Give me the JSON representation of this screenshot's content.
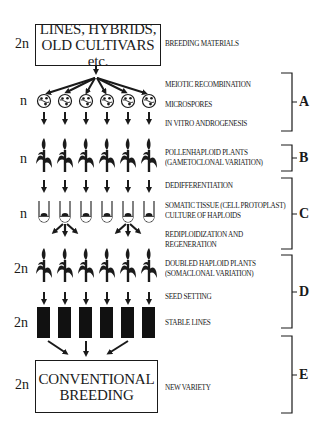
{
  "top_box": {
    "ploidy": "2n",
    "line1": "LINES, HYBRIDS,",
    "line2": "OLD CULTIVARS etc."
  },
  "bottom_box": {
    "ploidy": "2n",
    "line1": "CONVENTIONAL",
    "line2": "BREEDING"
  },
  "ploidy_labels": {
    "microspores": "n",
    "pollen_plants": "n",
    "tubes": "n",
    "doubled_plants": "2n",
    "stable_lines": "2n"
  },
  "stage_labels": {
    "breeding_materials": "BREEDING MATERIALS",
    "meiotic_recombination": "MEIOTIC RECOMBINATION",
    "microspores": "MICROSPORES",
    "in_vitro_androgenesis": "IN VITRO ANDROGENESIS",
    "pollenhaploid_plants": "POLLENHAPLOID PLANTS",
    "gametoclonal_variation": "(GAMETOCLONAL VARIATION)",
    "dedifferentiation": "DEDIFFERENTIATION",
    "somatic_tissue": "SOMATIC TISSUE (CELL PROTOPLAST)",
    "culture_of_haploids": "CULTURE OF HAPLOIDS",
    "rediploidization": "REDIPLOIDIZATION AND",
    "regeneration": "REGENERATION",
    "doubled_haploid_plants": "DOUBLED HAPLOID PLANTS",
    "somaclonal_variation": "(SOMACLONAL VARIATION)",
    "seed_setting": "SEED SETTING",
    "stable_lines": "STABLE LINES",
    "new_variety": "NEW VARIETY"
  },
  "brackets": [
    {
      "letter": "A",
      "top": 73,
      "bottom": 131
    },
    {
      "letter": "B",
      "top": 145,
      "bottom": 171
    },
    {
      "letter": "C",
      "top": 178,
      "bottom": 249
    },
    {
      "letter": "D",
      "top": 255,
      "bottom": 328
    },
    {
      "letter": "E",
      "top": 336,
      "bottom": 413
    }
  ],
  "columns_x": [
    44,
    65,
    86,
    107,
    128,
    149
  ],
  "icons": {
    "microspore": "microspore-cell-icon",
    "plant": "maize-plant-icon",
    "tube": "test-tube-icon",
    "stable_line": "black-bar-icon"
  }
}
